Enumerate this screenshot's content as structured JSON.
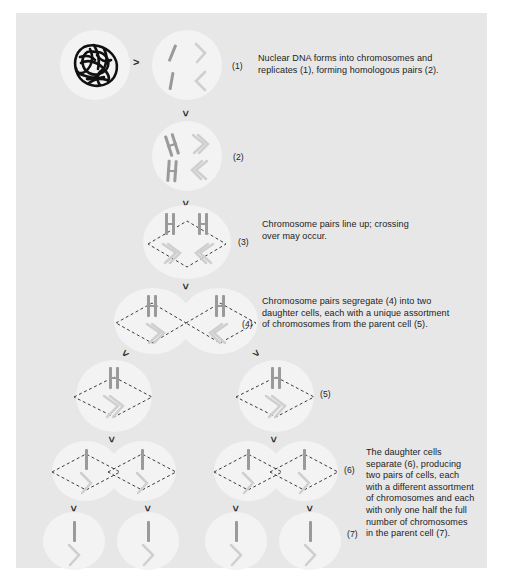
{
  "figure": {
    "background_color": "#e7e7e7",
    "outer_color": "#ffffff",
    "cell_color": "#f3f3f3",
    "chromosome_dark": "#9a9a9a",
    "chromosome_light": "#cfcfcf",
    "dna_color": "#111111",
    "arrow_glyph": ">"
  },
  "markers": {
    "m1": "(1)",
    "m2": "(2)",
    "m3": "(3)",
    "m4": "(4)",
    "m5": "(5)",
    "m6": "(6)",
    "m7": "(7)"
  },
  "notes": {
    "n1": {
      "marker": "(1)",
      "lines": [
        "Nuclear DNA forms into chromosomes and",
        "replicates (1), forming homologous pairs (2)."
      ]
    },
    "n3": {
      "marker": "(3)",
      "lines": [
        "Chromosome pairs line up; crossing",
        "over may occur."
      ]
    },
    "n4": {
      "marker": "(4)",
      "lines": [
        "Chromosome pairs segregate (4) into two",
        "daughter cells, each with a unique assortment",
        "of chromosomes from the parent cell (5)."
      ]
    },
    "n7": {
      "marker": "(7)",
      "lines": [
        "The daughter cells",
        "separate (6), producing",
        "two pairs of cells, each",
        "with a different assortment",
        "of chromosomes and each",
        "with only one half the full",
        "number of chromosomes",
        "in the parent cell (7)."
      ]
    }
  },
  "stages": [
    {
      "id": "stage-0",
      "label": "interphase-nucleus",
      "cells": 1,
      "content": "tangled-dna"
    },
    {
      "id": "stage-1",
      "label": "condensed-chromosomes",
      "cells": 1,
      "content": "four-single-chromosomes"
    },
    {
      "id": "stage-2",
      "label": "replicated-homologous-pairs",
      "cells": 1,
      "content": "four-x-chromosomes"
    },
    {
      "id": "stage-3",
      "label": "metaphase-i-alignment",
      "cells": 1,
      "content": "aligned-pairs-with-spindle"
    },
    {
      "id": "stage-4",
      "label": "anaphase-i-segregation",
      "cells": 2,
      "content": "segregating-pairs-with-spindle"
    },
    {
      "id": "stage-5",
      "label": "daughter-cells",
      "cells": 2,
      "content": "single-pair-with-spindle"
    },
    {
      "id": "stage-6",
      "label": "meiosis-ii-division",
      "cells": 4,
      "content": "split-chromatids-with-spindle"
    },
    {
      "id": "stage-7",
      "label": "four-haploid-cells",
      "cells": 4,
      "content": "one-chromatid-each"
    }
  ]
}
